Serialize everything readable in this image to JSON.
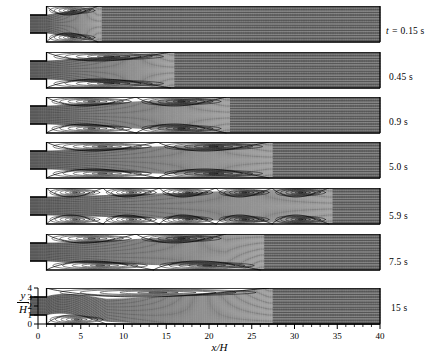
{
  "figure": {
    "type": "streamline-contour-series"
  },
  "axes": {
    "x": {
      "label": "x/H",
      "ticks": [
        0,
        5,
        10,
        15,
        20,
        25,
        30,
        35,
        40
      ],
      "minor_tick_step": 1,
      "range": [
        0,
        40
      ]
    },
    "y": {
      "label_numerator": "y",
      "label_denominator": "H",
      "ticks": [
        0,
        1,
        2,
        3,
        4
      ],
      "range": [
        0,
        4
      ]
    }
  },
  "panels": [
    {
      "time_label": "t = 0.15 s",
      "time_prefix": "t =",
      "time_value": "0.15 s",
      "has_prefix": true
    },
    {
      "time_label": "0.45 s",
      "time_prefix": "",
      "time_value": "0.45 s",
      "has_prefix": false
    },
    {
      "time_label": "0.9 s",
      "time_prefix": "",
      "time_value": "0.9 s",
      "has_prefix": false
    },
    {
      "time_label": "5.0 s",
      "time_prefix": "",
      "time_value": "5.0 s",
      "has_prefix": false
    },
    {
      "time_label": "5.9 s",
      "time_prefix": "",
      "time_value": "5.9 s",
      "has_prefix": false
    },
    {
      "time_label": "7.5 s",
      "time_prefix": "",
      "time_value": "7.5 s",
      "has_prefix": false
    },
    {
      "time_label": "15 s",
      "time_prefix": "",
      "time_value": "15 s",
      "has_prefix": false
    }
  ],
  "chart_data": {
    "type": "line",
    "title": "",
    "xlabel": "x/H",
    "ylabel": "y/H",
    "xlim": [
      0,
      40
    ],
    "ylim": [
      0,
      4
    ],
    "grid": false,
    "legend": "none",
    "x_ticks": [
      0,
      5,
      10,
      15,
      20,
      25,
      30,
      35,
      40
    ],
    "y_ticks": [
      0,
      1,
      2,
      3,
      4
    ],
    "panel_times_s": [
      0.15,
      0.45,
      0.9,
      5.0,
      5.9,
      7.5,
      15
    ],
    "panel_time_labels": [
      "t = 0.15 s",
      "0.45 s",
      "0.9 s",
      "5.0 s",
      "5.9 s",
      "7.5 s",
      "15 s"
    ],
    "geometry": {
      "inlet_channel_y_range": [
        1,
        3
      ],
      "expansion_duct_y_range": [
        0,
        4
      ],
      "step_x": 1.0,
      "inlet_extends_to_x": -1.0,
      "expansion_ratio": 2
    },
    "series": [
      {
        "name": "t = 0.15 s",
        "upper_recirculation_reattachment_xH": 7.0,
        "lower_recirculation_reattachment_xH": 7.0,
        "symmetric": true,
        "n_vortex_cells_upper": 1,
        "n_vortex_cells_lower": 1,
        "jet_spread_xH": 8.5,
        "vortex_centers": [
          {
            "x": 3.2,
            "y": 3.45
          },
          {
            "x": 3.2,
            "y": 0.55
          }
        ]
      },
      {
        "name": "0.45 s",
        "upper_recirculation_reattachment_xH": 15.5,
        "lower_recirculation_reattachment_xH": 15.5,
        "symmetric": true,
        "n_vortex_cells_upper": 1,
        "n_vortex_cells_lower": 1,
        "jet_spread_xH": 17.0,
        "vortex_centers": [
          {
            "x": 6.5,
            "y": 3.55
          },
          {
            "x": 6.5,
            "y": 0.45
          }
        ]
      },
      {
        "name": "0.9 s",
        "upper_recirculation_reattachment_xH": 22.0,
        "lower_recirculation_reattachment_xH": 22.0,
        "symmetric": true,
        "n_vortex_cells_upper": 2,
        "n_vortex_cells_lower": 2,
        "jet_spread_xH": 24.0,
        "vortex_centers": [
          {
            "x": 6.0,
            "y": 3.55
          },
          {
            "x": 15.0,
            "y": 3.5
          },
          {
            "x": 6.0,
            "y": 0.45
          },
          {
            "x": 15.0,
            "y": 0.5
          }
        ]
      },
      {
        "name": "5.0 s",
        "upper_recirculation_reattachment_xH": 27.0,
        "lower_recirculation_reattachment_xH": 27.0,
        "symmetric": true,
        "n_vortex_cells_upper": 2,
        "n_vortex_cells_lower": 2,
        "jet_spread_xH": 30.0,
        "vortex_centers": [
          {
            "x": 5.5,
            "y": 3.6
          },
          {
            "x": 17.0,
            "y": 3.5
          },
          {
            "x": 5.5,
            "y": 0.4
          },
          {
            "x": 17.0,
            "y": 0.5
          }
        ]
      },
      {
        "name": "5.9 s",
        "upper_recirculation_reattachment_xH": 34.0,
        "lower_recirculation_reattachment_xH": 34.0,
        "symmetric": true,
        "n_vortex_cells_upper": 5,
        "n_vortex_cells_lower": 5,
        "jet_spread_xH": 36.0,
        "vortex_centers": [
          {
            "x": 4.5,
            "y": 3.55
          },
          {
            "x": 11.0,
            "y": 3.5
          },
          {
            "x": 17.5,
            "y": 3.5
          },
          {
            "x": 24.0,
            "y": 3.5
          },
          {
            "x": 30.5,
            "y": 3.5
          },
          {
            "x": 4.5,
            "y": 0.45
          },
          {
            "x": 11.0,
            "y": 0.5
          },
          {
            "x": 17.5,
            "y": 0.5
          },
          {
            "x": 24.0,
            "y": 0.5
          },
          {
            "x": 30.5,
            "y": 0.5
          }
        ]
      },
      {
        "name": "7.5 s",
        "upper_recirculation_reattachment_xH": 22.0,
        "lower_recirculation_reattachment_xH": 26.0,
        "symmetric": false,
        "n_vortex_cells_upper": 2,
        "n_vortex_cells_lower": 2,
        "jet_spread_xH": 28.0,
        "vortex_centers": [
          {
            "x": 6.0,
            "y": 3.6
          },
          {
            "x": 17.0,
            "y": 3.55
          },
          {
            "x": 7.0,
            "y": 0.4
          },
          {
            "x": 20.0,
            "y": 0.45
          }
        ]
      },
      {
        "name": "15 s",
        "upper_recirculation_reattachment_xH": 27.0,
        "lower_recirculation_reattachment_xH": 8.0,
        "symmetric": false,
        "n_vortex_cells_upper": 1,
        "n_vortex_cells_lower": 1,
        "jet_spread_xH": 30.0,
        "vortex_centers": [
          {
            "x": 12.0,
            "y": 3.5
          },
          {
            "x": 3.5,
            "y": 0.5
          }
        ]
      }
    ]
  },
  "style": {
    "line_color": "#000000",
    "background": "#ffffff",
    "wall_color": "#000000"
  }
}
